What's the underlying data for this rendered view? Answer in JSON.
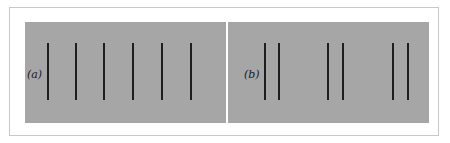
{
  "figure": {
    "panels": [
      {
        "label": "(a)",
        "line_offsets": [
          22,
          50,
          78,
          107,
          136,
          165
        ]
      },
      {
        "label": "(b)",
        "line_offsets": [
          36,
          50,
          99,
          114,
          164,
          179
        ]
      }
    ]
  },
  "colors": {
    "background": "#a6a6a6",
    "line": "#1e1e1e",
    "frame": "#c8c8c8"
  }
}
